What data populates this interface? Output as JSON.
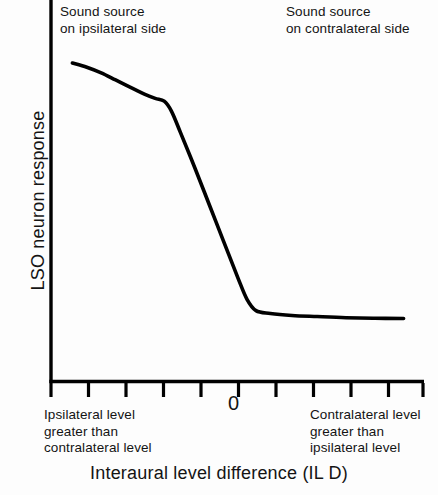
{
  "chart_data": {
    "type": "line",
    "title": "",
    "xlabel": "Interaural level difference (IL D)",
    "ylabel": "LSO neuron response",
    "xlim": [
      -5,
      5
    ],
    "ylim": [
      0,
      1
    ],
    "grid": false,
    "legend": null,
    "x_tick_labels": [
      "",
      "",
      "",
      "",
      "0",
      "",
      "",
      "",
      "",
      ""
    ],
    "zero_tick_label": "0",
    "n_ticks": 11,
    "annotations": [
      {
        "name": "ipsilateral-note",
        "text": "Sound source\non ipsilateral side",
        "position": "top-left"
      },
      {
        "name": "contralateral-note",
        "text": "Sound source\non contralateral side",
        "position": "top-right"
      },
      {
        "name": "left-axis-note",
        "text": "Ipsilateral level\ngreater than\ncontralateral level",
        "position": "below-axis-left"
      },
      {
        "name": "right-axis-note",
        "text": "Contralateral level\ngreater than\nipsilateral level",
        "position": "below-axis-right"
      }
    ],
    "series": [
      {
        "name": "LSO neuron response",
        "color": "#000000",
        "x": [
          -4.6,
          -4.2,
          -3.8,
          -3.4,
          -3.0,
          -2.6,
          -2.3,
          -2.05,
          -1.85,
          -1.6,
          -1.2,
          -0.8,
          -0.4,
          0.0,
          0.25,
          0.5,
          0.9,
          1.5,
          2.2,
          3.0,
          3.8,
          4.6
        ],
        "y": [
          1.0,
          0.985,
          0.965,
          0.94,
          0.915,
          0.89,
          0.875,
          0.865,
          0.83,
          0.755,
          0.63,
          0.5,
          0.37,
          0.24,
          0.165,
          0.125,
          0.115,
          0.108,
          0.104,
          0.1,
          0.098,
          0.097
        ]
      }
    ]
  },
  "figure": {
    "axis_color": "#000000",
    "curve_color": "#000000",
    "background": "#fdfdfd",
    "ylabel": "LSO neuron response",
    "xlabel": "Interaural level difference (IL D)",
    "zero_label": "0",
    "annot_ipsi": "Sound source\non ipsilateral side",
    "annot_contra": "Sound source\non contralateral side",
    "note_left": "Ipsilateral level\ngreater than\ncontralateral level",
    "note_right": "Contralateral level\ngreater than\nipsilateral level"
  }
}
